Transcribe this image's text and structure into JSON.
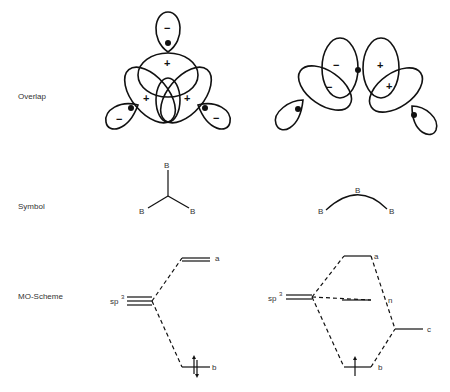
{
  "rows": {
    "overlap": "Overlap",
    "symbol": "Symbol",
    "mo_scheme": "MO-Scheme"
  },
  "overlap": {
    "left": {
      "signs": [
        "−",
        "+",
        "+",
        "+",
        "−",
        "−"
      ],
      "description": "three-center closed B-B-B bond orbital overlap"
    },
    "right": {
      "signs": [
        "−",
        "−",
        "+",
        "+"
      ],
      "description": "three-center open B-B-B bond orbital overlap"
    }
  },
  "symbol": {
    "left": {
      "atoms": [
        "B",
        "B",
        "B"
      ],
      "type": "closed"
    },
    "right": {
      "atoms": [
        "B",
        "B",
        "B"
      ],
      "type": "open"
    }
  },
  "mo_scheme": {
    "left": {
      "ao_label": "sp",
      "ao_sup": "3",
      "levels": {
        "antibonding": "a",
        "bonding": "b"
      }
    },
    "right": {
      "ao_label": "sp",
      "ao_sup": "3",
      "levels": {
        "antibonding": "a",
        "nonbonding": "n",
        "p": "c",
        "bonding": "b"
      }
    }
  }
}
